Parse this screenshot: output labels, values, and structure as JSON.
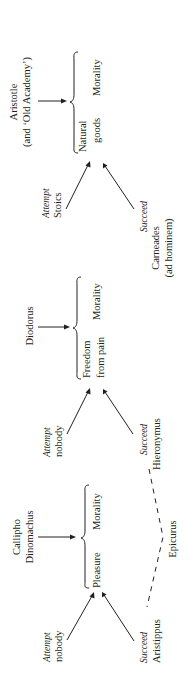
{
  "diagram": {
    "orientation": "rotated-90-ccw",
    "panels": [
      {
        "id": "aristotle",
        "heading_lines": [
          "Aristotle",
          "(and ‘Old Academy’)"
        ],
        "grouped_terms": [
          "Natural",
          "goods",
          "Morality"
        ],
        "attempt": {
          "label": "Attempt",
          "who": "Stoics"
        },
        "succeed": {
          "label": "Succeed",
          "who_lines": [
            "Carneades",
            "(ad hominem)"
          ]
        }
      },
      {
        "id": "diodorus",
        "heading_lines": [
          "Diodorus"
        ],
        "grouped_terms": [
          "Freedom",
          "from pain",
          "Morality"
        ],
        "attempt": {
          "label": "Attempt",
          "who": "nobody"
        },
        "succeed": {
          "label": "Succeed",
          "who_lines": [
            "Hieronymus"
          ]
        }
      },
      {
        "id": "callipho",
        "heading_lines": [
          "Callipho",
          "Dinomachus"
        ],
        "grouped_terms": [
          "Pleasure",
          "Morality"
        ],
        "attempt": {
          "label": "Attempt",
          "who": "nobody"
        },
        "succeed": {
          "label": "Succeed",
          "who_lines": [
            "Aristippus"
          ]
        }
      }
    ],
    "dashed_link_label": "Epicurus"
  }
}
